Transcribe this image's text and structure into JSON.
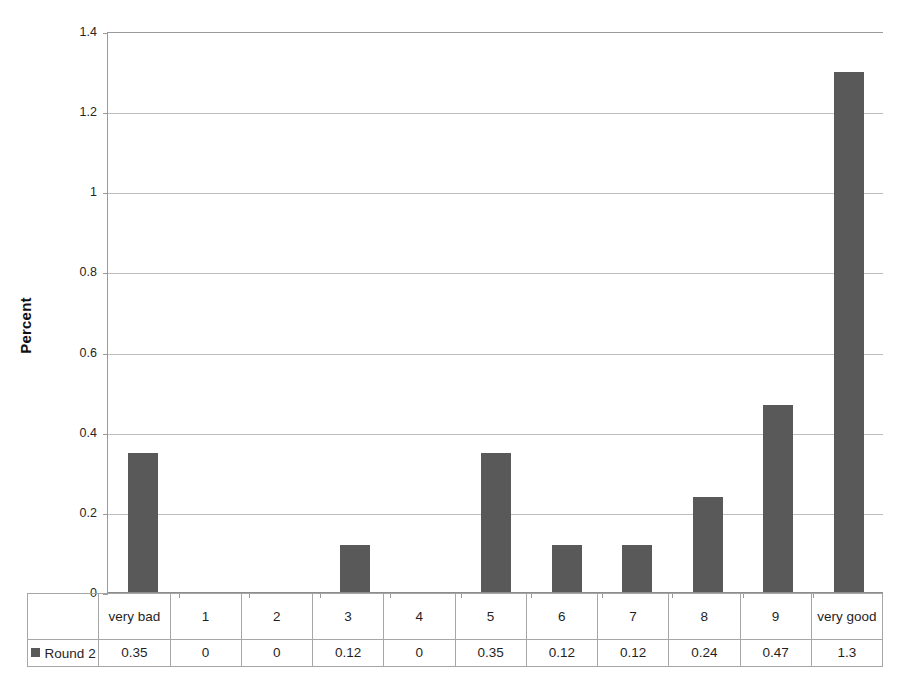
{
  "chart_data": {
    "type": "bar",
    "title": "",
    "xlabel": "",
    "ylabel": "Percent",
    "categories": [
      "very bad",
      "1",
      "2",
      "3",
      "4",
      "5",
      "6",
      "7",
      "8",
      "9",
      "very good"
    ],
    "series": [
      {
        "name": "Round 2",
        "values": [
          0.35,
          0,
          0,
          0.12,
          0,
          0.35,
          0.12,
          0.12,
          0.24,
          0.47,
          1.3
        ],
        "color": "#595959"
      }
    ],
    "value_labels": [
      "0.35",
      "0",
      "0",
      "0.12",
      "0",
      "0.35",
      "0.12",
      "0.12",
      "0.24",
      "0.47",
      "1.3"
    ],
    "ylim": [
      0,
      1.4
    ],
    "yticks": [
      0,
      0.2,
      0.4,
      0.6,
      0.8,
      1,
      1.2,
      1.4
    ],
    "ytick_labels": [
      "0",
      "0.2",
      "0.4",
      "0.6",
      "0.8",
      "1",
      "1.2",
      "1.4"
    ],
    "grid": true,
    "legend_position": "data-table-row-header",
    "has_data_table": true
  },
  "axis": {
    "y_title": "Percent",
    "y_tick_labels": [
      "1.4",
      "1.2",
      "1",
      "0.8",
      "0.6",
      "0.4",
      "0.2",
      "0"
    ]
  },
  "table": {
    "legend_label": "Round 2",
    "legend_swatch_color": "#595959",
    "categories": [
      "very bad",
      "1",
      "2",
      "3",
      "4",
      "5",
      "6",
      "7",
      "8",
      "9",
      "very good"
    ],
    "values": [
      "0.35",
      "0",
      "0",
      "0.12",
      "0",
      "0.35",
      "0.12",
      "0.12",
      "0.24",
      "0.47",
      "1.3"
    ]
  },
  "colors": {
    "bar": "#595959",
    "gridline": "#bfbfbf",
    "axis": "#9a9a9a",
    "table_border": "#a6a6a6",
    "background": "#ffffff"
  }
}
